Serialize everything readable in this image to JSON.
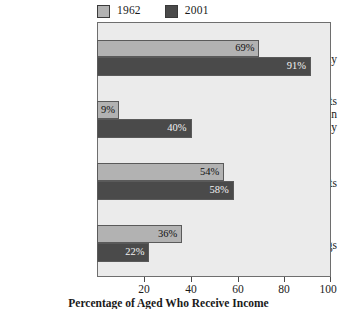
{
  "chart_data": {
    "type": "bar",
    "orientation": "horizontal",
    "title": "",
    "xlabel": "Percentage of Aged Who Receive Income",
    "ylabel": "",
    "xlim": [
      0,
      100
    ],
    "xticks": [
      20,
      40,
      60,
      80,
      100
    ],
    "xtick_labels": [
      "20",
      "40",
      "60",
      "80",
      "100"
    ],
    "grid": false,
    "legend_position": "top-left",
    "categories": [
      "Social Security",
      "Retirement benefits other than Social Security",
      "Income from assets",
      "Earnings"
    ],
    "category_lines": [
      [
        "Social Security"
      ],
      [
        "Retirement benefits",
        "other than",
        "Social Security"
      ],
      [
        "Income from assets"
      ],
      [
        "Earnings"
      ]
    ],
    "series": [
      {
        "name": "1962",
        "color": "#b2b2b2",
        "values": [
          69,
          9,
          54,
          36
        ],
        "value_labels": [
          "69%",
          "40%",
          "54%",
          "36%"
        ]
      },
      {
        "name": "2001",
        "color": "#4a4a4a",
        "values": [
          91,
          40,
          58,
          22
        ],
        "value_labels": [
          "91%",
          "40%",
          "58%",
          "22%"
        ]
      }
    ],
    "bars": [
      {
        "category": "Social Security",
        "series": "1962",
        "value": 69,
        "label": "69%",
        "label_align": "right"
      },
      {
        "category": "Social Security",
        "series": "2001",
        "value": 91,
        "label": "91%",
        "label_align": "right"
      },
      {
        "category": "Retirement benefits other than Social Security",
        "series": "1962",
        "value": 9,
        "label": "9%",
        "label_align": "left"
      },
      {
        "category": "Retirement benefits other than Social Security",
        "series": "2001",
        "value": 40,
        "label": "40%",
        "label_align": "right"
      },
      {
        "category": "Income from assets",
        "series": "1962",
        "value": 54,
        "label": "54%",
        "label_align": "right"
      },
      {
        "category": "Income from assets",
        "series": "2001",
        "value": 58,
        "label": "58%",
        "label_align": "right"
      },
      {
        "category": "Earnings",
        "series": "1962",
        "value": 36,
        "label": "36%",
        "label_align": "right"
      },
      {
        "category": "Earnings",
        "series": "2001",
        "value": 22,
        "label": "22%",
        "label_align": "right"
      }
    ]
  },
  "legend": {
    "items": [
      {
        "label": "1962",
        "color": "#b2b2b2"
      },
      {
        "label": "2001",
        "color": "#4a4a4a"
      }
    ]
  },
  "axis": {
    "tick_labels": [
      "20",
      "40",
      "60",
      "80",
      "100"
    ],
    "title": "Percentage of Aged Who Receive Income"
  },
  "colors": {
    "series_1962": "#b2b2b2",
    "series_2001": "#4a4a4a",
    "plot_background": "#ebebeb",
    "frame": "#6e6e6e",
    "page_background": "#ffffff"
  }
}
